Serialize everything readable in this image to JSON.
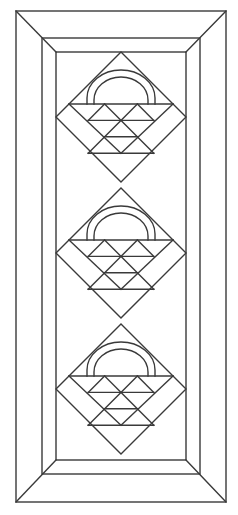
{
  "diagram": {
    "colors": {
      "background": "#ffffff",
      "stroke": "#3a3a3a"
    },
    "borders": [
      {
        "name": "outer-border",
        "style": "mitered"
      },
      {
        "name": "inner-border",
        "style": "mitered"
      }
    ],
    "blocks": {
      "count": 3,
      "arrangement": "vertical column, set on point",
      "block_type": "basket",
      "basket": {
        "handle_arcs": 2,
        "triangle_rows": 4
      }
    }
  }
}
